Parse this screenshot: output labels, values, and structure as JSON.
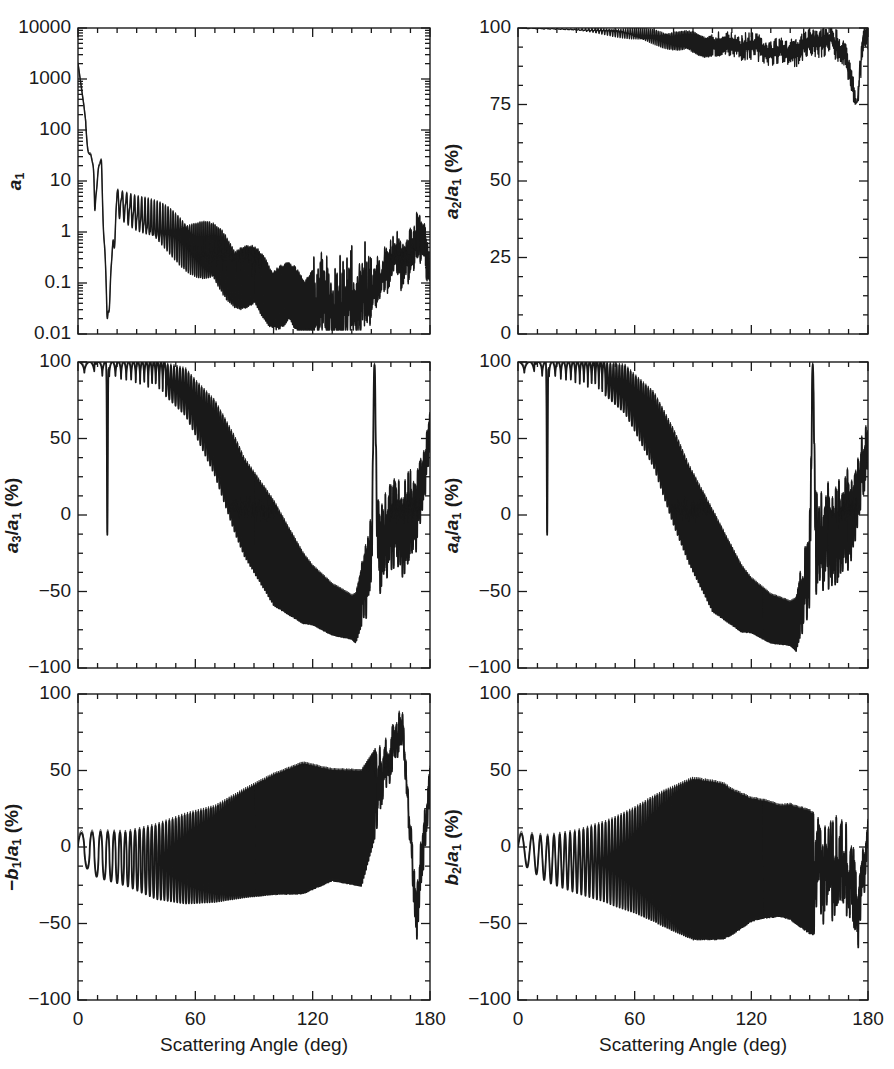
{
  "figure": {
    "width": 894,
    "height": 1069,
    "background": "#ffffff",
    "line_color": "#1a1a1a",
    "panel_count": 6,
    "layout": "3 rows x 2 columns"
  },
  "axis": {
    "x_title": "Scattering Angle (deg)",
    "x_ticks": [
      "0",
      "60",
      "120",
      "180"
    ],
    "x_tick_values": [
      0,
      60,
      120,
      180
    ],
    "x_minor_step": 10,
    "x_range": [
      0,
      180
    ],
    "pct_ticks": [
      "100",
      "50",
      "0",
      "-50",
      "-100"
    ],
    "pct_tick_values": [
      100,
      50,
      0,
      -50,
      -100
    ],
    "pct_range": [
      -100,
      100
    ],
    "pct_minor_step": 12.5,
    "a2_ticks": [
      "100",
      "75",
      "50",
      "25",
      "0"
    ],
    "a2_tick_values": [
      100,
      75,
      50,
      25,
      0
    ],
    "a2_range": [
      0,
      100
    ],
    "a2_minor_step": 6.25,
    "log_ticks": [
      "10000",
      "1000",
      "100",
      "10",
      "1",
      "0.1",
      "0.01"
    ],
    "log_tick_values": [
      10000,
      1000,
      100,
      10,
      1,
      0.1,
      0.01
    ],
    "log_range": [
      0.01,
      10000
    ]
  },
  "chart_data": [
    {
      "id": "a1",
      "type": "line",
      "position": "top-left",
      "title": "",
      "xlabel": "",
      "ylabel": "a_1",
      "ylabel_html": "<i>a</i><sub>1</sub>",
      "yscale": "log",
      "ylim": [
        0.01,
        10000
      ],
      "xlim": [
        0,
        180
      ],
      "xtick_labels_shown": false,
      "ytick_labels": [
        "10000",
        "1000",
        "100",
        "10",
        "1",
        "0.1",
        "0.01"
      ],
      "series": [
        {
          "name": "curve-solid-thick",
          "style": "solid"
        },
        {
          "name": "curve-solid-thin",
          "style": "solid"
        }
      ],
      "description": "Forward-scattering peak near 2000 at 0 deg falling steeply to ~10 by 10 deg, strongly oscillating ripple structure decaying to ~0.03 near 130 deg, then rising back to ~1 at 180 deg. Deep narrow minimum to 0.02 near 15 deg.",
      "envelope_points": [
        {
          "x": 0,
          "y": 2000
        },
        {
          "x": 3,
          "y": 300
        },
        {
          "x": 6,
          "y": 30
        },
        {
          "x": 9,
          "y": 10
        },
        {
          "x": 12,
          "y": 20
        },
        {
          "x": 15,
          "y": 0.02
        },
        {
          "x": 20,
          "y": 4
        },
        {
          "x": 30,
          "y": 2.2
        },
        {
          "x": 45,
          "y": 1.1
        },
        {
          "x": 60,
          "y": 0.5
        },
        {
          "x": 75,
          "y": 0.22
        },
        {
          "x": 90,
          "y": 0.1
        },
        {
          "x": 105,
          "y": 0.05
        },
        {
          "x": 120,
          "y": 0.04
        },
        {
          "x": 135,
          "y": 0.035
        },
        {
          "x": 150,
          "y": 0.06
        },
        {
          "x": 160,
          "y": 0.25
        },
        {
          "x": 170,
          "y": 0.3
        },
        {
          "x": 176,
          "y": 1.0
        },
        {
          "x": 180,
          "y": 0.2
        }
      ]
    },
    {
      "id": "a2_over_a1",
      "type": "line",
      "position": "top-right",
      "title": "",
      "xlabel": "",
      "ylabel": "a_2/a_1 (%)",
      "ylabel_html": "<i>a</i><sub>2</sub>/<i>a</i><sub>1</sub> (%)",
      "yscale": "linear",
      "ylim": [
        0,
        100
      ],
      "xlim": [
        0,
        180
      ],
      "xtick_labels_shown": false,
      "ytick_labels": [
        "100",
        "75",
        "50",
        "25",
        "0"
      ],
      "series": [
        {
          "name": "curve-solid",
          "style": "solid"
        }
      ],
      "description": "Starts at 100% and stays near 100 until ~50 deg, then slow decline with ripples to ~92-96% between 90 and 150 deg, sharp dip to ~75% near 175 deg, recovering to ~100 at 180 deg.",
      "envelope_points": [
        {
          "x": 0,
          "y": 100
        },
        {
          "x": 20,
          "y": 99.7
        },
        {
          "x": 40,
          "y": 99.2
        },
        {
          "x": 60,
          "y": 98.0
        },
        {
          "x": 80,
          "y": 96.0
        },
        {
          "x": 95,
          "y": 94.5
        },
        {
          "x": 110,
          "y": 95.0
        },
        {
          "x": 125,
          "y": 93.0
        },
        {
          "x": 140,
          "y": 92.0
        },
        {
          "x": 150,
          "y": 95.0
        },
        {
          "x": 160,
          "y": 96.0
        },
        {
          "x": 168,
          "y": 93.0
        },
        {
          "x": 174,
          "y": 75.0
        },
        {
          "x": 178,
          "y": 99.0
        },
        {
          "x": 180,
          "y": 96.0
        }
      ]
    },
    {
      "id": "a3_over_a1",
      "type": "line",
      "position": "middle-left",
      "title": "",
      "xlabel": "",
      "ylabel": "a_3/a_1 (%)",
      "ylabel_html": "<i>a</i><sub>3</sub>/<i>a</i><sub>1</sub> (%)",
      "yscale": "linear",
      "ylim": [
        -100,
        100
      ],
      "xlim": [
        0,
        180
      ],
      "xtick_labels_shown": false,
      "ytick_labels": [
        "100",
        "50",
        "0",
        "-50",
        "-100"
      ],
      "series": [
        {
          "name": "curve-solid-thick",
          "style": "solid"
        },
        {
          "name": "curve-solid-thin",
          "style": "solid"
        }
      ],
      "description": "Near +100% with narrow downward spikes until ~45 deg; one deep spike to -13% near 15 deg. Oscillation amplitude grows, mean drifts down crossing 0 near 85 deg, reaching about -80% near 135-150 deg, spike back to +100 near 152 deg, then large oscillations 50 to -90 to 180 deg.",
      "mean_points": [
        {
          "x": 0,
          "y": 97
        },
        {
          "x": 20,
          "y": 96
        },
        {
          "x": 40,
          "y": 92
        },
        {
          "x": 55,
          "y": 80
        },
        {
          "x": 70,
          "y": 50
        },
        {
          "x": 85,
          "y": 5
        },
        {
          "x": 100,
          "y": -25
        },
        {
          "x": 115,
          "y": -48
        },
        {
          "x": 130,
          "y": -62
        },
        {
          "x": 142,
          "y": -68
        },
        {
          "x": 152,
          "y": -20
        },
        {
          "x": 162,
          "y": -10
        },
        {
          "x": 172,
          "y": 0
        },
        {
          "x": 180,
          "y": 50
        }
      ],
      "amplitude_points": [
        {
          "x": 0,
          "y": 4
        },
        {
          "x": 20,
          "y": 8
        },
        {
          "x": 40,
          "y": 16
        },
        {
          "x": 60,
          "y": 35
        },
        {
          "x": 80,
          "y": 62
        },
        {
          "x": 100,
          "y": 68
        },
        {
          "x": 120,
          "y": 38
        },
        {
          "x": 140,
          "y": 28
        },
        {
          "x": 155,
          "y": 55
        },
        {
          "x": 170,
          "y": 55
        },
        {
          "x": 180,
          "y": 30
        }
      ]
    },
    {
      "id": "a4_over_a1",
      "type": "line",
      "position": "middle-right",
      "title": "",
      "xlabel": "",
      "ylabel": "a_4/a_1 (%)",
      "ylabel_html": "<i>a</i><sub>4</sub>/<i>a</i><sub>1</sub> (%)",
      "yscale": "linear",
      "ylim": [
        -100,
        100
      ],
      "xlim": [
        0,
        180
      ],
      "xtick_labels_shown": false,
      "ytick_labels": [
        "100",
        "50",
        "0",
        "-50",
        "-100"
      ],
      "series": [
        {
          "name": "curve-solid-thick",
          "style": "solid"
        },
        {
          "name": "curve-solid-thin",
          "style": "solid"
        }
      ],
      "description": "Very similar to a3/a1: near +100 with narrow dips until ~45 deg including deep spike to -13% at 15 deg, declining mean crossing zero near 88 deg, bottoming near -85% around 130-150 deg with oscillation down to -100, spike to +100 near 152 deg, then oscillations to 180 deg.",
      "mean_points": [
        {
          "x": 0,
          "y": 97
        },
        {
          "x": 20,
          "y": 96
        },
        {
          "x": 40,
          "y": 92
        },
        {
          "x": 55,
          "y": 82
        },
        {
          "x": 70,
          "y": 55
        },
        {
          "x": 88,
          "y": 0
        },
        {
          "x": 100,
          "y": -30
        },
        {
          "x": 115,
          "y": -55
        },
        {
          "x": 130,
          "y": -68
        },
        {
          "x": 143,
          "y": -72
        },
        {
          "x": 152,
          "y": -22
        },
        {
          "x": 162,
          "y": -12
        },
        {
          "x": 172,
          "y": 0
        },
        {
          "x": 180,
          "y": 48
        }
      ],
      "amplitude_points": [
        {
          "x": 0,
          "y": 4
        },
        {
          "x": 20,
          "y": 8
        },
        {
          "x": 40,
          "y": 16
        },
        {
          "x": 60,
          "y": 36
        },
        {
          "x": 80,
          "y": 62
        },
        {
          "x": 100,
          "y": 66
        },
        {
          "x": 120,
          "y": 35
        },
        {
          "x": 140,
          "y": 28
        },
        {
          "x": 155,
          "y": 58
        },
        {
          "x": 170,
          "y": 55
        },
        {
          "x": 180,
          "y": 30
        }
      ]
    },
    {
      "id": "minus_b1_over_a1",
      "type": "line",
      "position": "bottom-left",
      "title": "",
      "xlabel": "Scattering Angle (deg)",
      "ylabel": "-b_1/a_1 (%)",
      "ylabel_html": "&minus;<i>b</i><sub>1</sub>/<i>a</i><sub>1</sub> (%)",
      "yscale": "linear",
      "ylim": [
        -100,
        100
      ],
      "xlim": [
        0,
        180
      ],
      "xtick_labels_shown": true,
      "ytick_labels": [
        "100",
        "50",
        "0",
        "-50",
        "-100"
      ],
      "series": [
        {
          "name": "curve-solid-thick",
          "style": "solid"
        },
        {
          "name": "curve-solid-thin",
          "style": "solid"
        }
      ],
      "description": "Oscillates about a slowly rising mean: near 0 to -10% with +-30% swings from 0 to 40 deg, mean rising to about +10% by 90 deg with swings of +-60%, maxima reaching +95% near 110-150 deg with minima near -95%. Broad plateau near +95% at 160-170 deg, dip to -100 near 175, ends near +40 at 180.",
      "mean_points": [
        {
          "x": 0,
          "y": 0
        },
        {
          "x": 10,
          "y": -5
        },
        {
          "x": 25,
          "y": -8
        },
        {
          "x": 40,
          "y": -10
        },
        {
          "x": 55,
          "y": -8
        },
        {
          "x": 70,
          "y": -5
        },
        {
          "x": 85,
          "y": 2
        },
        {
          "x": 100,
          "y": 8
        },
        {
          "x": 115,
          "y": 12
        },
        {
          "x": 130,
          "y": 14
        },
        {
          "x": 145,
          "y": 12
        },
        {
          "x": 158,
          "y": 55
        },
        {
          "x": 166,
          "y": 80
        },
        {
          "x": 173,
          "y": -50
        },
        {
          "x": 178,
          "y": 20
        },
        {
          "x": 180,
          "y": 40
        }
      ],
      "amplitude_points": [
        {
          "x": 0,
          "y": 18
        },
        {
          "x": 10,
          "y": 30
        },
        {
          "x": 25,
          "y": 35
        },
        {
          "x": 40,
          "y": 48
        },
        {
          "x": 55,
          "y": 58
        },
        {
          "x": 70,
          "y": 62
        },
        {
          "x": 85,
          "y": 70
        },
        {
          "x": 100,
          "y": 78
        },
        {
          "x": 115,
          "y": 85
        },
        {
          "x": 130,
          "y": 72
        },
        {
          "x": 145,
          "y": 75
        },
        {
          "x": 158,
          "y": 40
        },
        {
          "x": 168,
          "y": 20
        },
        {
          "x": 176,
          "y": 45
        },
        {
          "x": 180,
          "y": 25
        }
      ]
    },
    {
      "id": "b2_over_a1",
      "type": "line",
      "position": "bottom-right",
      "title": "Scattering Angle (deg)",
      "xlabel": "Scattering Angle (deg)",
      "ylabel": "b_2/a_1 (%)",
      "ylabel_html": "<i>b</i><sub>2</sub>/<i>a</i><sub>1</sub> (%)",
      "yscale": "linear",
      "ylim": [
        -100,
        100
      ],
      "xlim": [
        0,
        180
      ],
      "xtick_labels_shown": true,
      "ytick_labels": [
        "100",
        "50",
        "0",
        "-50",
        "-100"
      ],
      "series": [
        {
          "name": "curve-solid-thick",
          "style": "solid"
        },
        {
          "name": "curve-solid-thin",
          "style": "solid"
        }
      ],
      "description": "Symmetric oscillation about approximately -10% mean. Amplitude grows from +-20% at 0 deg to full +-100% saturation between 80 and 115 deg, then decreases to +-80% by 150 deg, broad features near 160-175 deg with minimum near -95%, ending near 0 at 180 deg.",
      "mean_points": [
        {
          "x": 0,
          "y": 0
        },
        {
          "x": 15,
          "y": -8
        },
        {
          "x": 30,
          "y": -10
        },
        {
          "x": 50,
          "y": -10
        },
        {
          "x": 70,
          "y": -8
        },
        {
          "x": 90,
          "y": -8
        },
        {
          "x": 110,
          "y": -10
        },
        {
          "x": 125,
          "y": -8
        },
        {
          "x": 140,
          "y": -10
        },
        {
          "x": 155,
          "y": -20
        },
        {
          "x": 168,
          "y": -10
        },
        {
          "x": 175,
          "y": -40
        },
        {
          "x": 180,
          "y": 5
        }
      ],
      "amplitude_points": [
        {
          "x": 0,
          "y": 18
        },
        {
          "x": 15,
          "y": 30
        },
        {
          "x": 30,
          "y": 40
        },
        {
          "x": 45,
          "y": 52
        },
        {
          "x": 60,
          "y": 68
        },
        {
          "x": 75,
          "y": 88
        },
        {
          "x": 90,
          "y": 105
        },
        {
          "x": 105,
          "y": 102
        },
        {
          "x": 120,
          "y": 80
        },
        {
          "x": 135,
          "y": 72
        },
        {
          "x": 150,
          "y": 80
        },
        {
          "x": 165,
          "y": 70
        },
        {
          "x": 175,
          "y": 55
        },
        {
          "x": 180,
          "y": 30
        }
      ]
    }
  ]
}
